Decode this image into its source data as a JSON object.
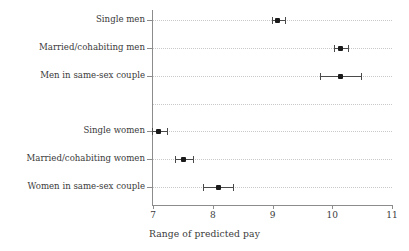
{
  "chart_data": {
    "type": "scatter",
    "title": "",
    "xlabel": "Range of predicted pay",
    "ylabel": "",
    "xlim": [
      6.72,
      11.12
    ],
    "xticks": [
      7,
      8,
      9,
      10,
      11
    ],
    "xtick_labels": [
      "7",
      "8",
      "9",
      "10",
      "11"
    ],
    "grid": true,
    "grid_style": "dotted horizontal",
    "legend": "none",
    "orientation": "horizontal",
    "marker": "square-dot with horizontal error bars and caps",
    "categories": [
      "Single men",
      "Married/cohabiting men",
      "Men in same-sex couple",
      "",
      "Single women",
      "Married/cohabiting women",
      "Women in same-sex couple"
    ],
    "points": [
      {
        "label": "Single men",
        "value": 9.08,
        "low": 8.99,
        "high": 9.21
      },
      {
        "label": "Married/cohabiting men",
        "value": 10.14,
        "low": 10.03,
        "high": 10.26
      },
      {
        "label": "Men in same-sex couple",
        "value": 10.14,
        "low": 9.8,
        "high": 10.48
      },
      {
        "label": "",
        "value": null,
        "low": null,
        "high": null
      },
      {
        "label": "Single women",
        "value": 7.1,
        "low": 6.98,
        "high": 7.23
      },
      {
        "label": "Married/cohabiting women",
        "value": 7.51,
        "low": 7.37,
        "high": 7.67
      },
      {
        "label": "Women in same-sex couple",
        "value": 8.09,
        "low": 7.84,
        "high": 8.34
      }
    ]
  },
  "colors": {
    "marker": "#1a1a1a",
    "errorbar": "#4a4a4a",
    "axis": "#8c8c8c",
    "grid": "#c9c9c9",
    "text": "#3a3a3a",
    "background": "#ffffff"
  }
}
